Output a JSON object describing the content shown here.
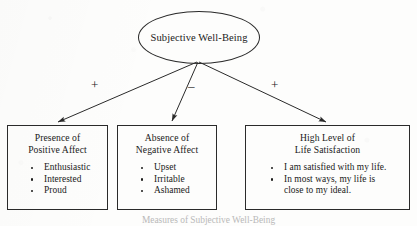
{
  "diagram": {
    "root": {
      "label": "Subjective Well-Being"
    },
    "edges": [
      {
        "sign": "+",
        "target": "Presence of Positive Affect"
      },
      {
        "sign": "–",
        "target": "Absence of Negative Affect"
      },
      {
        "sign": "+",
        "target": "High Level of Life Satisfaction"
      }
    ],
    "signs": {
      "left": "+",
      "middle": "–",
      "right": "+"
    },
    "boxes": [
      {
        "heading_line1": "Presence of",
        "heading_line2": "Positive Affect",
        "items": [
          "Enthusiastic",
          "Interested",
          "Proud"
        ]
      },
      {
        "heading_line1": "Absence of",
        "heading_line2": "Negative Affect",
        "items": [
          "Upset",
          "Irritable",
          "Ashamed"
        ]
      },
      {
        "heading_line1": "High Level of",
        "heading_line2": "Life Satisfaction",
        "items": [
          "I am satisfied with my life."
        ],
        "item2_line1": "In most ways, my life is",
        "item2_line2": "close to my ideal."
      }
    ],
    "caption": "Measures of Subjective Well-Being"
  },
  "colors": {
    "stroke": "#2a2a2a",
    "text": "#1a1a1a",
    "background": "#fdfdfc"
  }
}
